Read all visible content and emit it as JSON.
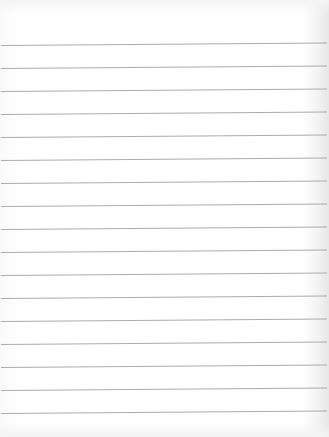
{
  "page": {
    "type": "lined-notebook-paper",
    "background_color": "#ffffff",
    "line_color": "#a3a3a3",
    "line_count": 17,
    "line_spacing_px": 23,
    "first_line_y_px": 45,
    "text": ""
  },
  "rules": [
    {
      "y": 45
    },
    {
      "y": 68
    },
    {
      "y": 91
    },
    {
      "y": 114
    },
    {
      "y": 137
    },
    {
      "y": 160
    },
    {
      "y": 183
    },
    {
      "y": 206
    },
    {
      "y": 229
    },
    {
      "y": 252
    },
    {
      "y": 275
    },
    {
      "y": 298
    },
    {
      "y": 321
    },
    {
      "y": 344
    },
    {
      "y": 367
    },
    {
      "y": 390
    },
    {
      "y": 413
    }
  ]
}
